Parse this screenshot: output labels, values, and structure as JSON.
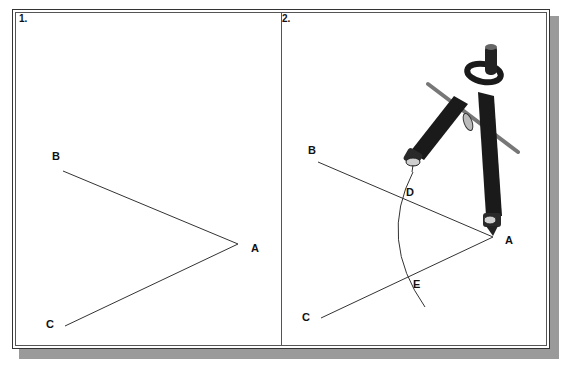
{
  "panels": [
    {
      "number": "1.",
      "points": {
        "A": {
          "label": "A",
          "x": 238,
          "y": 244
        },
        "B": {
          "label": "B",
          "x": 63,
          "y": 171
        },
        "C": {
          "label": "C",
          "x": 65,
          "y": 326
        }
      }
    },
    {
      "number": "2.",
      "points": {
        "A": {
          "label": "A",
          "x": 493,
          "y": 237
        },
        "B": {
          "label": "B",
          "x": 318,
          "y": 162
        },
        "C": {
          "label": "C",
          "x": 321,
          "y": 318
        },
        "D": {
          "label": "D",
          "x": 398,
          "y": 196
        },
        "E": {
          "label": "E",
          "x": 403,
          "y": 280
        }
      },
      "arc": "M413,172 Q378,240 425,307",
      "tool": "compass"
    }
  ],
  "colors": {
    "line": "#333333",
    "frame": "#333333",
    "shadow": "#9a9a9a",
    "compass": "#1a1a1a"
  }
}
